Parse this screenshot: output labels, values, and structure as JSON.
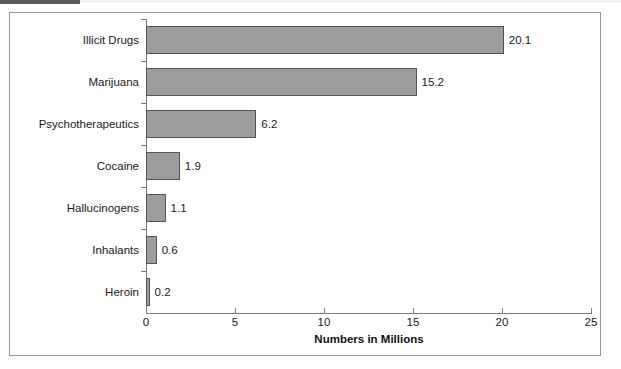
{
  "figure": {
    "frame_border_color": "#9a9a9a",
    "background": "#ffffff",
    "header_strip_color": "#595959"
  },
  "chart_data": {
    "type": "bar",
    "orientation": "horizontal",
    "title": "",
    "xlabel": "Numbers in Millions",
    "ylabel": "",
    "categories": [
      "Illicit Drugs",
      "Marijuana",
      "Psychotherapeutics",
      "Cocaine",
      "Hallucinogens",
      "Inhalants",
      "Heroin"
    ],
    "values": [
      20.1,
      15.2,
      6.2,
      1.9,
      1.1,
      0.6,
      0.2
    ],
    "value_labels": [
      "20.1",
      "15.2",
      "6.2",
      "1.9",
      "1.1",
      "0.6",
      "0.2"
    ],
    "xlim": [
      0,
      25
    ],
    "xticks": [
      0,
      5,
      10,
      15,
      20,
      25
    ],
    "xtick_labels": [
      "0",
      "5",
      "10",
      "15",
      "20",
      "25"
    ],
    "grid": false,
    "legend": null,
    "bar_fill_color": "#9d9d9d",
    "bar_border_color": "#535353",
    "axis_color": "#7a7a7a",
    "text_color": "#1a1a1a"
  }
}
